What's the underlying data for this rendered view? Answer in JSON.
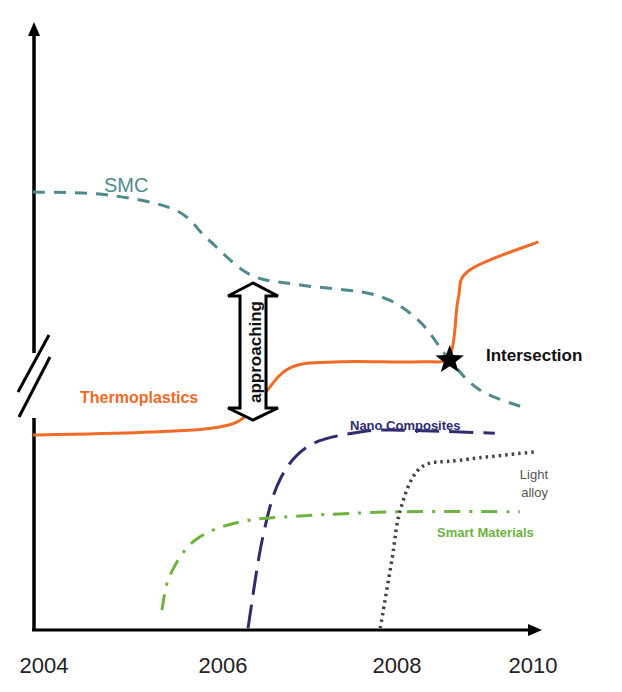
{
  "chart_data": {
    "type": "line",
    "title": "",
    "xlabel": "",
    "ylabel": "",
    "xlim": [
      2004,
      2010
    ],
    "ylim": [
      0,
      100
    ],
    "x_ticks": [
      "2004",
      "2006",
      "2008",
      "2010"
    ],
    "x_tick_values": [
      2004,
      2006,
      2008,
      2010
    ],
    "y_axis_break": true,
    "grid": false,
    "legend": "none (inline labels)",
    "series": [
      {
        "name": "SMC",
        "style": "dashed",
        "color": "#4f8a8e",
        "points": [
          [
            2004.0,
            73.0
          ],
          [
            2004.9,
            72.5
          ],
          [
            2005.7,
            70.0
          ],
          [
            2006.1,
            65.0
          ],
          [
            2006.6,
            59.2
          ],
          [
            2007.2,
            57.5
          ],
          [
            2008.1,
            55.8
          ],
          [
            2008.6,
            51.7
          ],
          [
            2008.98,
            45.0
          ],
          [
            2009.34,
            40.0
          ],
          [
            2009.88,
            37.0
          ]
        ]
      },
      {
        "name": "Thermoplastics",
        "style": "solid",
        "color": "#f06a28",
        "points": [
          [
            2004.0,
            32.5
          ],
          [
            2005.4,
            33.0
          ],
          [
            2006.35,
            34.2
          ],
          [
            2006.7,
            38.3
          ],
          [
            2007.07,
            43.7
          ],
          [
            2007.67,
            44.7
          ],
          [
            2008.62,
            44.7
          ],
          [
            2008.98,
            45.8
          ],
          [
            2009.08,
            55.0
          ],
          [
            2009.22,
            60.0
          ],
          [
            2010.04,
            64.7
          ]
        ]
      },
      {
        "name": "Nano Composites",
        "style": "long-dashed",
        "color": "#2e2e6e",
        "points": [
          [
            2006.57,
            0.3
          ],
          [
            2006.74,
            15.0
          ],
          [
            2006.95,
            25.0
          ],
          [
            2007.31,
            30.8
          ],
          [
            2007.91,
            33.0
          ],
          [
            2008.39,
            33.3
          ],
          [
            2009.52,
            32.8
          ]
        ]
      },
      {
        "name": "Smart Materials",
        "style": "dash-dot",
        "color": "#6cb33f",
        "points": [
          [
            2005.54,
            3.3
          ],
          [
            2005.64,
            9.2
          ],
          [
            2005.94,
            15.0
          ],
          [
            2006.47,
            18.0
          ],
          [
            2007.19,
            19.0
          ],
          [
            2008.39,
            19.7
          ],
          [
            2009.82,
            19.7
          ]
        ]
      },
      {
        "name": "Light alloy",
        "style": "dotted",
        "color": "#444444",
        "points": [
          [
            2008.15,
            0.3
          ],
          [
            2008.29,
            11.7
          ],
          [
            2008.39,
            20.0
          ],
          [
            2008.63,
            27.0
          ],
          [
            2009.11,
            28.3
          ],
          [
            2010.0,
            29.7
          ]
        ]
      }
    ],
    "annotations": [
      {
        "text": "approaching",
        "type": "double-arrow",
        "between": [
          "SMC",
          "Thermoplastics"
        ],
        "x": 2006.65
      },
      {
        "text": "Intersection",
        "type": "star-marker",
        "x": 2008.98,
        "y": 45.0
      }
    ],
    "labels": {
      "smc": "SMC",
      "thermoplastics": "Thermoplastics",
      "nano": "Nano Composites",
      "light_line1": "Light",
      "light_line2": "alloy",
      "smart": "Smart Materials",
      "approaching": "approaching",
      "intersection": "Intersection"
    }
  }
}
